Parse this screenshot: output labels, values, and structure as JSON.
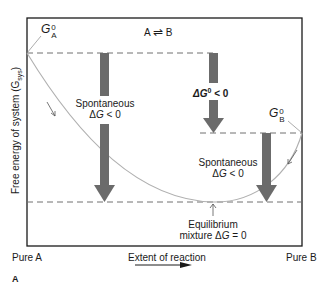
{
  "figure": {
    "panel_label": "A",
    "reaction": {
      "left": "A",
      "arrow": "⇌",
      "right": "B"
    },
    "y_axis_label": "Free energy of system (G",
    "y_axis_sub": "sys",
    "y_axis_close": ")",
    "x_axis_label": "Extent of reaction",
    "x_left_label": "Pure A",
    "x_right_label": "Pure B",
    "ga0": {
      "symbol": "G",
      "sup": "0",
      "sub": "A"
    },
    "gb0": {
      "symbol": "G",
      "sup": "0",
      "sub": "B"
    },
    "delta_g0": {
      "prefix": "ΔG",
      "sup": "0",
      "suffix": " < 0"
    },
    "spontaneous_left": {
      "line1": "Spontaneous",
      "line2_prefix": "Δ",
      "line2_var": "G",
      "line2_suffix": " < 0"
    },
    "spontaneous_right": {
      "line1": "Spontaneous",
      "line2_prefix": "Δ",
      "line2_var": "G",
      "line2_suffix": " < 0"
    },
    "equilibrium": {
      "line1": "Equilibrium",
      "line2_prefix": "mixture Δ",
      "line2_var": "G",
      "line2_suffix": " = 0"
    },
    "colors": {
      "arrow": "#6b6b6b",
      "curve": "#b0b0b0",
      "dash": "#707070",
      "frame": "#1a1a1a"
    }
  }
}
